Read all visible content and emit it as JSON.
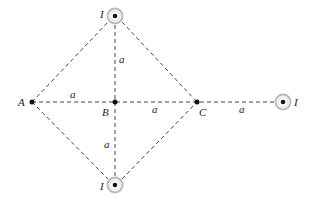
{
  "diagram": {
    "type": "current-wires-geometry",
    "points": {
      "A": {
        "label": "A",
        "x": 32,
        "y": 102
      },
      "B": {
        "label": "B",
        "x": 115,
        "y": 102
      },
      "C": {
        "label": "C",
        "x": 197,
        "y": 102
      }
    },
    "currents": [
      {
        "id": "top",
        "label": "I",
        "symbol": "out-of-page",
        "x": 115,
        "y": 16
      },
      {
        "id": "bottom",
        "label": "I",
        "symbol": "out-of-page",
        "x": 115,
        "y": 185
      },
      {
        "id": "right",
        "label": "I",
        "symbol": "out-of-page",
        "x": 283,
        "y": 102
      }
    ],
    "distance_labels": {
      "top_to_B": "a",
      "B_to_bottom": "a",
      "A_to_B": "a",
      "B_to_C": "a",
      "C_to_right": "a"
    },
    "colors": {
      "line": "#444444",
      "node": "#111111",
      "ring": "#bbbbbb"
    }
  }
}
